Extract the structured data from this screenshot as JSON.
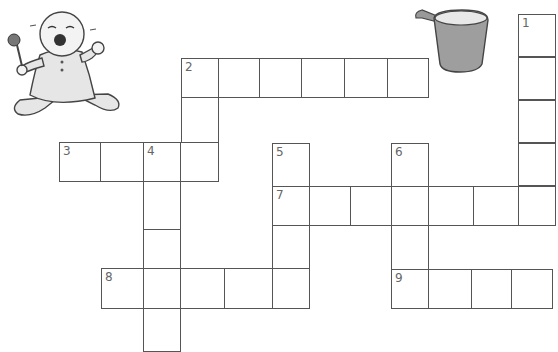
{
  "puzzle": {
    "clue_numbers": [
      "1",
      "2",
      "3",
      "4",
      "5",
      "6",
      "7",
      "8",
      "9"
    ],
    "colors": {
      "grid_line": "#555555",
      "cell_fill": "#ffffff",
      "number": "#666666"
    }
  },
  "images": {
    "baby": "crying-baby-with-rattle-illustration",
    "cup": "sippy-cup-illustration"
  },
  "cells": [
    {
      "x": 518,
      "y": 14,
      "w": 38,
      "h": 43,
      "n": "1"
    },
    {
      "x": 518,
      "y": 57,
      "w": 38,
      "h": 43
    },
    {
      "x": 518,
      "y": 100,
      "w": 38,
      "h": 43
    },
    {
      "x": 518,
      "y": 143,
      "w": 38,
      "h": 43
    },
    {
      "x": 518,
      "y": 186,
      "w": 38,
      "h": 40
    },
    {
      "x": 181,
      "y": 58,
      "w": 38,
      "h": 40,
      "n": "2"
    },
    {
      "x": 218,
      "y": 58,
      "w": 42,
      "h": 40
    },
    {
      "x": 259,
      "y": 58,
      "w": 43,
      "h": 40
    },
    {
      "x": 301,
      "y": 58,
      "w": 44,
      "h": 40
    },
    {
      "x": 344,
      "y": 58,
      "w": 44,
      "h": 40
    },
    {
      "x": 387,
      "y": 58,
      "w": 42,
      "h": 40
    },
    {
      "x": 181,
      "y": 97,
      "w": 38,
      "h": 46
    },
    {
      "x": 59,
      "y": 142,
      "w": 42,
      "h": 40,
      "n": "3"
    },
    {
      "x": 100,
      "y": 142,
      "w": 44,
      "h": 40
    },
    {
      "x": 143,
      "y": 142,
      "w": 38,
      "h": 40,
      "n": "4"
    },
    {
      "x": 180,
      "y": 142,
      "w": 39,
      "h": 40
    },
    {
      "x": 143,
      "y": 181,
      "w": 38,
      "h": 49
    },
    {
      "x": 143,
      "y": 229,
      "w": 38,
      "h": 40
    },
    {
      "x": 143,
      "y": 307,
      "w": 38,
      "h": 45
    },
    {
      "x": 272,
      "y": 143,
      "w": 38,
      "h": 44,
      "n": "5"
    },
    {
      "x": 391,
      "y": 143,
      "w": 38,
      "h": 44,
      "n": "6"
    },
    {
      "x": 272,
      "y": 186,
      "w": 38,
      "h": 40,
      "n": "7"
    },
    {
      "x": 309,
      "y": 186,
      "w": 42,
      "h": 40
    },
    {
      "x": 350,
      "y": 186,
      "w": 42,
      "h": 40
    },
    {
      "x": 391,
      "y": 186,
      "w": 38,
      "h": 40
    },
    {
      "x": 428,
      "y": 186,
      "w": 46,
      "h": 40
    },
    {
      "x": 473,
      "y": 186,
      "w": 46,
      "h": 40
    },
    {
      "x": 518,
      "y": 186,
      "w": 38,
      "h": 40
    },
    {
      "x": 272,
      "y": 225,
      "w": 38,
      "h": 44
    },
    {
      "x": 391,
      "y": 225,
      "w": 38,
      "h": 45
    },
    {
      "x": 101,
      "y": 268,
      "w": 43,
      "h": 41,
      "n": "8"
    },
    {
      "x": 143,
      "y": 268,
      "w": 38,
      "h": 41
    },
    {
      "x": 180,
      "y": 268,
      "w": 45,
      "h": 41
    },
    {
      "x": 224,
      "y": 268,
      "w": 49,
      "h": 41
    },
    {
      "x": 272,
      "y": 268,
      "w": 38,
      "h": 41
    },
    {
      "x": 391,
      "y": 269,
      "w": 38,
      "h": 40,
      "n": "9"
    },
    {
      "x": 428,
      "y": 269,
      "w": 44,
      "h": 40
    },
    {
      "x": 471,
      "y": 269,
      "w": 41,
      "h": 40
    },
    {
      "x": 511,
      "y": 269,
      "w": 42,
      "h": 40
    }
  ]
}
